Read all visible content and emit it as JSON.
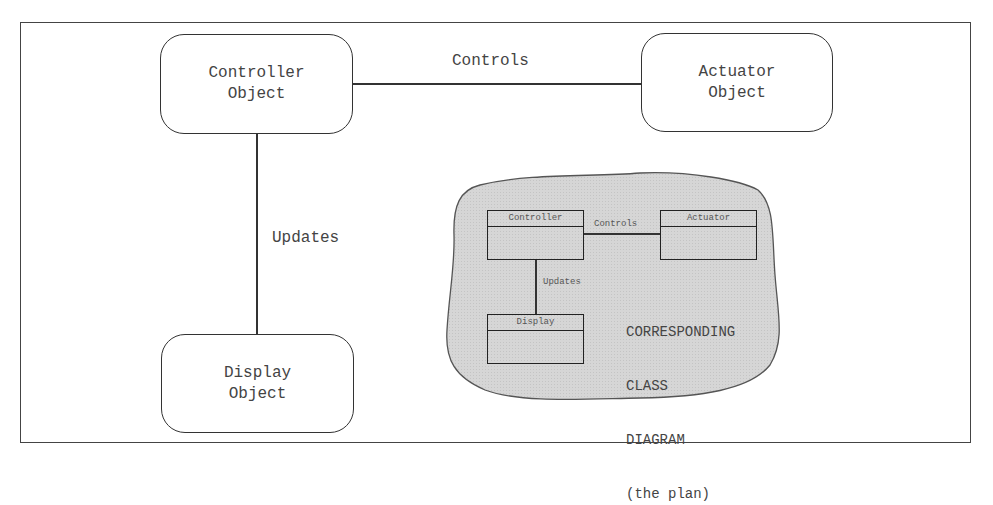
{
  "diagram": {
    "objects": {
      "controller": {
        "line1": "Controller",
        "line2": "Object"
      },
      "actuator": {
        "line1": "Actuator",
        "line2": "Object"
      },
      "display": {
        "line1": "Display",
        "line2": "Object"
      }
    },
    "associations": {
      "controls": "Controls",
      "updates": "Updates"
    },
    "class_diagram": {
      "classes": {
        "controller": "Controller",
        "actuator": "Actuator",
        "display": "Display"
      },
      "associations": {
        "controls": "Controls",
        "updates": "Updates"
      },
      "caption": {
        "line1": "CORRESPONDING",
        "line2": "CLASS",
        "line3": "DIAGRAM",
        "line4": "(the plan)"
      }
    },
    "colors": {
      "blob_fill": "#d4d4d4",
      "stroke": "#333333",
      "background": "#ffffff"
    }
  }
}
